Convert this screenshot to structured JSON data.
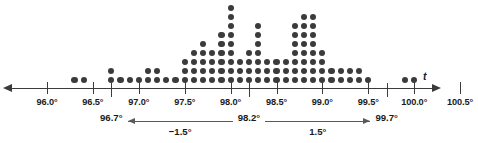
{
  "chart_data": {
    "type": "bar",
    "title": "",
    "subtitle": "",
    "xlabel": "t",
    "ylabel": "",
    "grid": false,
    "legend": null,
    "axis_variable": "t",
    "xlim": [
      95.75,
      100.75
    ],
    "x_tick_labels": [
      "96.0°",
      "96.5°",
      "97.0°",
      "97.5°",
      "98.0°",
      "98.5°",
      "99.0°",
      "99.5°",
      "100.0°",
      "100.5°"
    ],
    "x_tick_values": [
      96.0,
      96.5,
      97.0,
      97.5,
      98.0,
      98.5,
      99.0,
      99.5,
      100.0,
      100.5
    ],
    "x_step": 0.1,
    "categories": [
      96.3,
      96.4,
      96.7,
      96.8,
      96.9,
      97.0,
      97.1,
      97.2,
      97.3,
      97.4,
      97.5,
      97.6,
      97.7,
      97.8,
      97.9,
      98.0,
      98.1,
      98.2,
      98.3,
      98.4,
      98.5,
      98.6,
      98.7,
      98.8,
      98.9,
      99.0,
      99.1,
      99.2,
      99.3,
      99.4,
      99.5,
      99.9,
      100.0
    ],
    "values": [
      1,
      1,
      2,
      1,
      1,
      1,
      2,
      2,
      1,
      1,
      3,
      4,
      5,
      4,
      6,
      9,
      3,
      4,
      7,
      3,
      3,
      3,
      7,
      8,
      8,
      4,
      2,
      2,
      2,
      2,
      1,
      1,
      1
    ],
    "annotations": [
      {
        "name": "lower-bound",
        "value": 96.7,
        "label": "96.7°"
      },
      {
        "name": "mean",
        "value": 98.2,
        "label": "98.2°"
      },
      {
        "name": "upper-bound",
        "value": 99.7,
        "label": "99.7°"
      }
    ],
    "spans": [
      {
        "name": "left-span",
        "from": 98.2,
        "to": 96.7,
        "label": "−1.5°"
      },
      {
        "name": "right-span",
        "from": 98.2,
        "to": 99.7,
        "label": "1.5°"
      }
    ],
    "dot_color": "#3b3b3b",
    "axis_color": "#3b3b3b"
  }
}
